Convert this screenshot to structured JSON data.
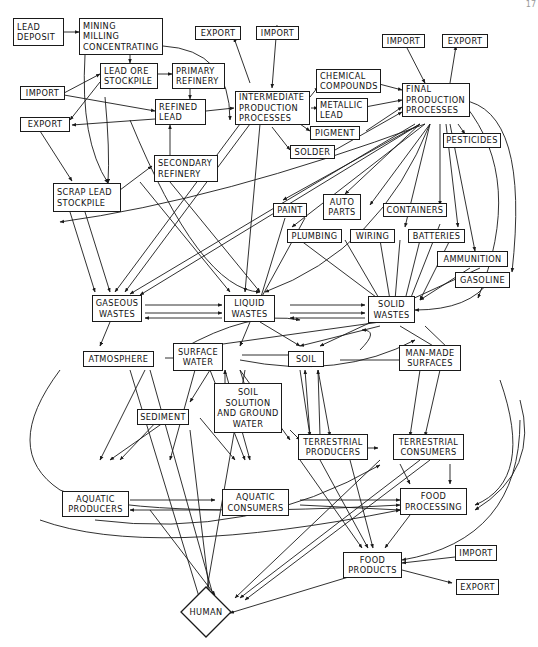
{
  "figure": {
    "page_number": "17"
  },
  "nodes": {
    "lead_deposit": {
      "lines": [
        "LEAD",
        "DEPOSIT"
      ]
    },
    "mining": {
      "lines": [
        "MINING",
        "MILLING",
        "CONCENTRATING"
      ]
    },
    "export_1": {
      "lines": [
        "EXPORT"
      ]
    },
    "import_1": {
      "lines": [
        "IMPORT"
      ]
    },
    "import_2": {
      "lines": [
        "IMPORT"
      ]
    },
    "export_2": {
      "lines": [
        "EXPORT"
      ]
    },
    "lead_ore_stockpile": {
      "lines": [
        "LEAD ORE",
        "STOCKPILE"
      ]
    },
    "primary_refinery": {
      "lines": [
        "PRIMARY",
        "REFINERY"
      ]
    },
    "import_left": {
      "lines": [
        "IMPORT"
      ]
    },
    "export_left": {
      "lines": [
        "EXPORT"
      ]
    },
    "refined_lead": {
      "lines": [
        "REFINED",
        "LEAD"
      ]
    },
    "intermediate": {
      "lines": [
        "INTERMEDIATE",
        "PRODUCTION",
        "PROCESSES"
      ]
    },
    "chemical_compounds": {
      "lines": [
        "CHEMICAL",
        "COMPOUNDS"
      ]
    },
    "metallic_lead": {
      "lines": [
        "METALLIC",
        "LEAD"
      ]
    },
    "pigment": {
      "lines": [
        "PIGMENT"
      ]
    },
    "solder": {
      "lines": [
        "SOLDER"
      ]
    },
    "final_production": {
      "lines": [
        "FINAL",
        "PRODUCTION",
        "PROCESSES"
      ]
    },
    "pesticides": {
      "lines": [
        "PESTICIDES"
      ]
    },
    "secondary_refinery": {
      "lines": [
        "SECONDARY",
        "REFINERY"
      ]
    },
    "scrap_lead_stockpile": {
      "lines": [
        "SCRAP LEAD",
        "STOCKPILE"
      ]
    },
    "paint": {
      "lines": [
        "PAINT"
      ]
    },
    "auto_parts": {
      "lines": [
        "AUTO",
        "PARTS"
      ]
    },
    "containers": {
      "lines": [
        "CONTAINERS"
      ]
    },
    "plumbing": {
      "lines": [
        "PLUMBING"
      ]
    },
    "wiring": {
      "lines": [
        "WIRING"
      ]
    },
    "batteries": {
      "lines": [
        "BATTERIES"
      ]
    },
    "ammunition": {
      "lines": [
        "AMMUNITION"
      ]
    },
    "gasoline": {
      "lines": [
        "GASOLINE"
      ]
    },
    "gaseous_wastes": {
      "lines": [
        "GASEOUS",
        "WASTES"
      ]
    },
    "liquid_wastes": {
      "lines": [
        "LIQUID",
        "WASTES"
      ]
    },
    "solid_wastes": {
      "lines": [
        "SOLID",
        "WASTES"
      ]
    },
    "atmosphere": {
      "lines": [
        "ATMOSPHERE"
      ]
    },
    "surface_water": {
      "lines": [
        "SURFACE",
        "WATER"
      ]
    },
    "soil": {
      "lines": [
        "SOIL"
      ]
    },
    "man_made_surfaces": {
      "lines": [
        "MAN-MADE",
        "SURFACES"
      ]
    },
    "sediment": {
      "lines": [
        "SEDIMENT"
      ]
    },
    "soil_solution": {
      "lines": [
        "SOIL",
        "SOLUTION",
        "AND GROUND",
        "WATER"
      ]
    },
    "terrestrial_producers": {
      "lines": [
        "TERRESTRIAL",
        "PRODUCERS"
      ]
    },
    "terrestrial_consumers": {
      "lines": [
        "TERRESTRIAL",
        "CONSUMERS"
      ]
    },
    "aquatic_producers": {
      "lines": [
        "AQUATIC",
        "PRODUCERS"
      ]
    },
    "aquatic_consumers": {
      "lines": [
        "AQUATIC",
        "CONSUMERS"
      ]
    },
    "food_processing": {
      "lines": [
        "FOOD",
        "PROCESSING"
      ]
    },
    "food_products": {
      "lines": [
        "FOOD",
        "PRODUCTS"
      ]
    },
    "import_food": {
      "lines": [
        "IMPORT"
      ]
    },
    "export_food": {
      "lines": [
        "EXPORT"
      ]
    },
    "human": {
      "lines": [
        "HUMAN"
      ]
    }
  },
  "colors": {
    "line": "#1a1a1a",
    "background": "#ffffff"
  }
}
